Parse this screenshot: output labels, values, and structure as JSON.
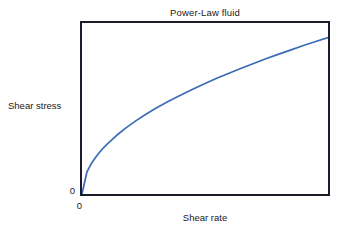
{
  "chart_data": {
    "type": "line",
    "title": "Power-Law fluid",
    "xlabel": "Shear rate",
    "ylabel": "Shear stress",
    "grid": false,
    "legend": null,
    "xlim": [
      0,
      1
    ],
    "ylim": [
      0,
      1
    ],
    "xtick_labels": [
      "0"
    ],
    "ytick_labels": [
      "0"
    ],
    "series": [
      {
        "name": "Power-Law fluid",
        "color": "#3a6bb5",
        "relation": "tau = K * shear_rate^n, n < 1 (shear-thinning)",
        "x": [
          0.0,
          0.02,
          0.04,
          0.06,
          0.08,
          0.1,
          0.14,
          0.18,
          0.22,
          0.26,
          0.3,
          0.35,
          0.4,
          0.45,
          0.5,
          0.55,
          0.6,
          0.65,
          0.7,
          0.75,
          0.8,
          0.85,
          0.9,
          0.95,
          1.0
        ],
        "y": [
          0.0,
          0.129,
          0.183,
          0.224,
          0.259,
          0.289,
          0.342,
          0.388,
          0.429,
          0.466,
          0.501,
          0.541,
          0.578,
          0.613,
          0.646,
          0.678,
          0.708,
          0.737,
          0.765,
          0.792,
          0.818,
          0.843,
          0.868,
          0.892,
          0.915
        ]
      }
    ]
  },
  "figure": {
    "background_color": "#ffffff",
    "frame_color": "#1b1b29",
    "text_color": "#1a1a22"
  }
}
